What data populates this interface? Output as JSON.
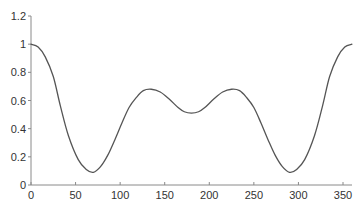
{
  "chart_data": {
    "type": "line",
    "title": "",
    "xlabel": "",
    "ylabel": "",
    "xlim": [
      0,
      360
    ],
    "ylim": [
      0,
      1.2
    ],
    "grid": false,
    "legend": null,
    "x_ticks": [
      0,
      50,
      100,
      150,
      200,
      250,
      300,
      350
    ],
    "x_tick_labels": [
      "0",
      "50",
      "100",
      "150",
      "200",
      "250",
      "300",
      "350"
    ],
    "y_ticks": [
      0,
      0.2,
      0.4,
      0.6,
      0.8,
      1,
      1.2
    ],
    "y_tick_labels": [
      "0",
      "0.2",
      "0.4",
      "0.6",
      "0.8",
      "1",
      "1.2"
    ],
    "series": [
      {
        "name": "curve",
        "color": "#555555",
        "x": [
          0,
          8,
          16,
          25,
          33,
          42,
          53,
          62,
          70,
          78,
          86,
          94,
          102,
          110,
          118,
          126,
          135,
          145,
          155,
          165,
          172,
          180,
          188,
          195,
          205,
          215,
          225,
          234,
          242,
          250,
          258,
          266,
          274,
          282,
          290,
          298,
          307,
          318,
          327,
          335,
          344,
          352,
          360
        ],
        "values": [
          1.0,
          0.98,
          0.91,
          0.77,
          0.56,
          0.35,
          0.18,
          0.11,
          0.09,
          0.13,
          0.21,
          0.32,
          0.44,
          0.55,
          0.62,
          0.67,
          0.68,
          0.66,
          0.61,
          0.55,
          0.52,
          0.51,
          0.52,
          0.55,
          0.61,
          0.66,
          0.68,
          0.67,
          0.62,
          0.55,
          0.44,
          0.32,
          0.21,
          0.13,
          0.09,
          0.11,
          0.18,
          0.35,
          0.56,
          0.77,
          0.91,
          0.98,
          1.0
        ]
      }
    ],
    "annotations": {
      "local_minima": [
        {
          "x": 70,
          "y": 0.09
        },
        {
          "x": 290,
          "y": 0.09
        }
      ],
      "local_maxima": [
        {
          "x": 135,
          "y": 0.68
        },
        {
          "x": 225,
          "y": 0.68
        }
      ],
      "central_trough": {
        "x": 180,
        "y": 0.51
      }
    }
  }
}
